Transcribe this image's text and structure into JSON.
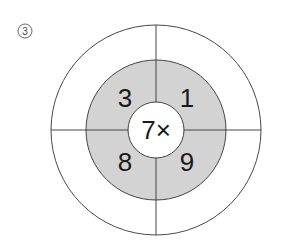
{
  "problem_label": "③",
  "diagram": {
    "center": "7×",
    "quadrants": {
      "top_left": "3",
      "top_right": "1",
      "bottom_left": "8",
      "bottom_right": "9"
    },
    "colors": {
      "ring_fill": "#d3d3d3",
      "line": "#333333",
      "background": "#ffffff"
    }
  }
}
